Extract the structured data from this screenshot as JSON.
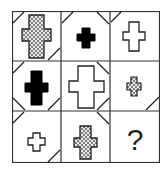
{
  "puzzle": {
    "type": "3x3 matrix reasoning",
    "question_mark": "?",
    "cells": [
      {
        "row": 0,
        "col": 0,
        "shape": "cross",
        "size": "large",
        "fill": "crosshatch",
        "corners": [
          "top-left",
          "bottom-right"
        ]
      },
      {
        "row": 0,
        "col": 1,
        "shape": "cross",
        "size": "small",
        "fill": "black",
        "corners": [
          "top-left",
          "top-right"
        ]
      },
      {
        "row": 0,
        "col": 2,
        "shape": "cross",
        "size": "medium",
        "fill": "white",
        "corners": [
          "top-left"
        ]
      },
      {
        "row": 1,
        "col": 0,
        "shape": "cross",
        "size": "medium",
        "fill": "black",
        "corners": [
          "top-left",
          "bottom-left",
          "bottom-right"
        ]
      },
      {
        "row": 1,
        "col": 1,
        "shape": "cross",
        "size": "large",
        "fill": "white",
        "corners": [
          "top-right",
          "bottom-right"
        ]
      },
      {
        "row": 1,
        "col": 2,
        "shape": "cross",
        "size": "small",
        "fill": "crosshatch",
        "corners": [
          "bottom-right"
        ]
      },
      {
        "row": 2,
        "col": 0,
        "shape": "cross",
        "size": "small",
        "fill": "white",
        "corners": [
          "top-left",
          "bottom-right"
        ]
      },
      {
        "row": 2,
        "col": 1,
        "shape": "cross",
        "size": "medium",
        "fill": "crosshatch",
        "corners": [
          "top-right"
        ]
      },
      {
        "row": 2,
        "col": 2,
        "shape": "unknown",
        "label": "?"
      }
    ],
    "colors": {
      "line": "#222222",
      "background": "#ffffff",
      "black_fill": "#000000"
    }
  }
}
